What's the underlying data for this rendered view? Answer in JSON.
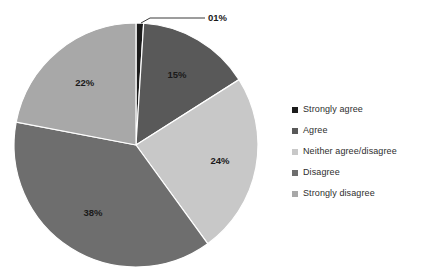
{
  "chart_data": {
    "type": "pie",
    "title": "",
    "subtitle": "",
    "xlabel": "",
    "ylabel": "",
    "grid": false,
    "legend_position": "right",
    "start_angle_deg": 0,
    "direction": "clockwise",
    "categories": [
      "Strongly agree",
      "Agree",
      "Neither agree/disagree",
      "Disagree",
      "Strongly disagree"
    ],
    "values": [
      1,
      15,
      24,
      38,
      22
    ],
    "data_labels": [
      "01%",
      "15%",
      "24%",
      "38%",
      "22%"
    ],
    "colors": [
      "#1c1c1c",
      "#595959",
      "#c8c8c8",
      "#6e6e6e",
      "#a8a8a8"
    ],
    "units": "percent",
    "total": 100
  },
  "legend": {
    "items": [
      {
        "label": "Strongly agree",
        "color": "#1c1c1c",
        "value": 1
      },
      {
        "label": "Agree",
        "color": "#595959",
        "value": 15
      },
      {
        "label": "Neither agree/disagree",
        "color": "#c8c8c8",
        "value": 24
      },
      {
        "label": "Disagree",
        "color": "#6e6e6e",
        "value": 38
      },
      {
        "label": "Strongly disagree",
        "color": "#a8a8a8",
        "value": 22
      }
    ]
  },
  "labels": {
    "strongly_agree": "01%",
    "agree": "15%",
    "neither": "24%",
    "disagree": "38%",
    "strongly_disagree": "22%"
  },
  "geometry": {
    "center_x": 136,
    "center_y": 145,
    "radius": 122
  }
}
